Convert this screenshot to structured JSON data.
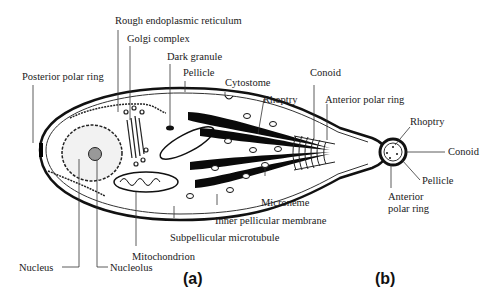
{
  "figure": {
    "panel_a_label": "(a)",
    "panel_b_label": "(b)",
    "panel_a": {
      "labels": {
        "rough_er": "Rough endoplasmic reticulum",
        "golgi": "Golgi complex",
        "dark_granule": "Dark granule",
        "pellicle": "Pellicle",
        "cytostome": "Cytostome",
        "conoid": "Conoid",
        "rhoptry": "Rhoptry",
        "anterior_polar_ring": "Anterior polar ring",
        "posterior_polar_ring": "Posterior polar ring",
        "microneme": "Microneme",
        "inner_pellicular_membrane": "Inner pellicular membrane",
        "subpellicular_microtubule": "Subpellicular microtubule",
        "mitochondrion": "Mitochondrion",
        "nucleus": "Nucleus",
        "nucleolus": "Nucleolus"
      }
    },
    "panel_b": {
      "labels": {
        "rhoptry": "Rhoptry",
        "conoid": "Conoid",
        "pellicle": "Pellicle",
        "anterior_polar_ring_line1": "Anterior",
        "anterior_polar_ring_line2": "polar ring"
      }
    }
  }
}
